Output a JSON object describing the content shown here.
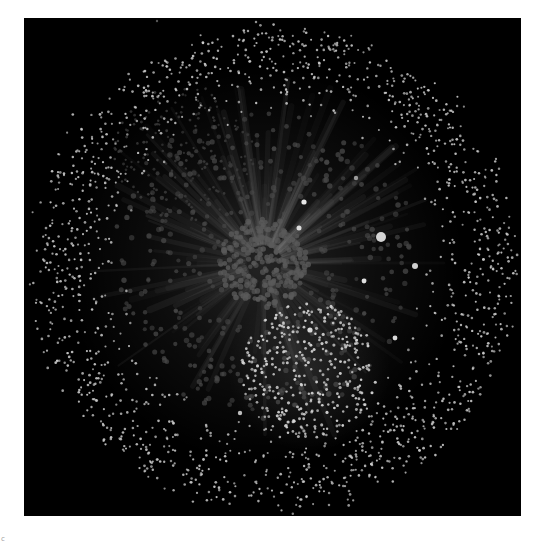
{
  "figure": {
    "type": "network-graph",
    "background": "#000000",
    "page_background": "#ffffff",
    "canvas": {
      "x": 24,
      "y": 18,
      "width": 497,
      "height": 498
    },
    "corner_mark": "c"
  },
  "graph": {
    "layout": "force-directed",
    "seed": 7,
    "clusters": [
      {
        "name": "central-hub-cluster",
        "cx": 240,
        "cy": 245,
        "r": 45,
        "count": 230,
        "node_r": 2.6,
        "color": "#5a5a5a",
        "opacity": 0.85
      },
      {
        "name": "hub-ring",
        "cx": 240,
        "cy": 245,
        "r": 150,
        "inner": 40,
        "count": 380,
        "node_r": 2.4,
        "color": "#4a4a4a",
        "opacity": 0.75
      },
      {
        "name": "upper-left-dim-cluster",
        "cx": 160,
        "cy": 135,
        "r": 70,
        "count": 170,
        "node_r": 1.3,
        "color": "#3c3c3c",
        "opacity": 0.9
      },
      {
        "name": "lower-bright-cluster",
        "cx": 285,
        "cy": 352,
        "r": 68,
        "count": 330,
        "node_r": 1.4,
        "color": "#d8d8d8",
        "opacity": 0.95
      },
      {
        "name": "outer-periphery",
        "cx": 250,
        "cy": 250,
        "r": 240,
        "inner": 150,
        "count": 1500,
        "node_r": 1.2,
        "color": "#cfcfcf",
        "opacity": 0.9
      }
    ],
    "edges": {
      "count": 140,
      "color": "#ffffff",
      "opacity": 0.035,
      "width": 5,
      "hub": {
        "cx": 240,
        "cy": 245
      },
      "length_min": 60,
      "length_max": 190
    },
    "glow": {
      "center": {
        "cx": 240,
        "cy": 245
      },
      "r": 200,
      "color": "#ffffff",
      "opacity": 0.12
    },
    "highlight_nodes": [
      {
        "x": 357,
        "y": 219,
        "r": 5.0,
        "color": "#d4d4d4"
      },
      {
        "x": 280,
        "y": 184,
        "r": 2.6,
        "color": "#e6e6e6"
      },
      {
        "x": 275,
        "y": 210,
        "r": 2.5,
        "color": "#dcdcdc"
      },
      {
        "x": 391,
        "y": 248,
        "r": 3.0,
        "color": "#d0d0d0"
      },
      {
        "x": 340,
        "y": 263,
        "r": 2.4,
        "color": "#e0e0e0"
      },
      {
        "x": 286,
        "y": 312,
        "r": 2.6,
        "color": "#d8d8d8"
      },
      {
        "x": 371,
        "y": 320,
        "r": 2.4,
        "color": "#d8d8d8"
      },
      {
        "x": 332,
        "y": 160,
        "r": 2.2,
        "color": "#9a9a9a"
      },
      {
        "x": 216,
        "y": 395,
        "r": 2.2,
        "color": "#bcbcbc"
      },
      {
        "x": 133,
        "y": 3,
        "r": 1.2,
        "color": "#555555"
      }
    ]
  }
}
